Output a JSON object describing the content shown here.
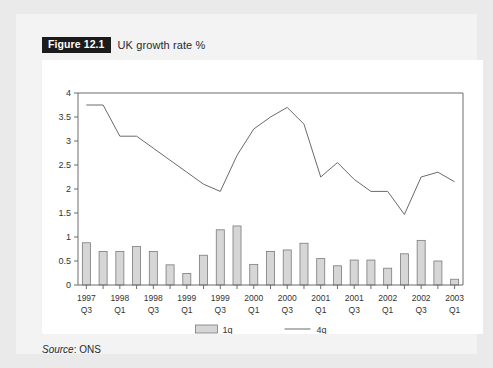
{
  "figure": {
    "badge": "Figure 12.1",
    "title": "UK growth rate %"
  },
  "source": {
    "label": "Source",
    "separator": ":",
    "value": "ONS",
    "full": "Source: ONS"
  },
  "colors": {
    "page_background": "#eaeaea",
    "card_background": "#f3f3f3",
    "plot_background": "#ffffff",
    "badge_background": "#1b1b1b",
    "badge_text": "#ffffff",
    "bar_fill": "#d6d6d6",
    "bar_stroke": "#7a7a7a",
    "line_stroke": "#6a6a6a",
    "axis": "#6d6d6d",
    "text": "#333333"
  },
  "chart_data": {
    "type": "bar",
    "title": "UK growth rate %",
    "xlabel": "",
    "ylabel": "",
    "ylim": [
      0,
      4
    ],
    "yticks": [
      0,
      0.5,
      1,
      1.5,
      2,
      2.5,
      3,
      3.5,
      4
    ],
    "ytick_labels": [
      "0",
      "0.5",
      "1",
      "1.5",
      "2",
      "2.5",
      "3",
      "3.5",
      "4"
    ],
    "grid": false,
    "legend_position": "bottom-center",
    "categories": [
      "1997 Q3",
      "1997 Q4",
      "1998 Q1",
      "1998 Q2",
      "1998 Q3",
      "1998 Q4",
      "1999 Q1",
      "1999 Q2",
      "1999 Q3",
      "1999 Q4",
      "2000 Q1",
      "2000 Q2",
      "2000 Q3",
      "2000 Q4",
      "2001 Q1",
      "2001 Q2",
      "2001 Q3",
      "2001 Q4",
      "2002 Q1",
      "2002 Q2",
      "2002 Q3",
      "2002 Q4",
      "2003 Q1"
    ],
    "xtick_labels": [
      {
        "index": 0,
        "year": "1997",
        "quarter": "Q3"
      },
      {
        "index": 2,
        "year": "1998",
        "quarter": "Q1"
      },
      {
        "index": 4,
        "year": "1998",
        "quarter": "Q3"
      },
      {
        "index": 6,
        "year": "1999",
        "quarter": "Q1"
      },
      {
        "index": 8,
        "year": "1999",
        "quarter": "Q3"
      },
      {
        "index": 10,
        "year": "2000",
        "quarter": "Q1"
      },
      {
        "index": 12,
        "year": "2000",
        "quarter": "Q3"
      },
      {
        "index": 14,
        "year": "2001",
        "quarter": "Q1"
      },
      {
        "index": 16,
        "year": "2001",
        "quarter": "Q3"
      },
      {
        "index": 18,
        "year": "2002",
        "quarter": "Q1"
      },
      {
        "index": 20,
        "year": "2002",
        "quarter": "Q3"
      },
      {
        "index": 22,
        "year": "2003",
        "quarter": "Q1"
      }
    ],
    "series": [
      {
        "name": "1q",
        "type": "bar",
        "values": [
          0.88,
          0.7,
          0.7,
          0.8,
          0.7,
          0.42,
          0.24,
          0.62,
          1.15,
          1.23,
          0.43,
          0.7,
          0.73,
          0.87,
          0.55,
          0.4,
          0.52,
          0.52,
          0.35,
          0.65,
          0.93,
          0.5,
          0.12
        ]
      },
      {
        "name": "4q",
        "type": "line",
        "values": [
          3.75,
          3.75,
          3.1,
          3.1,
          2.85,
          2.6,
          2.35,
          2.1,
          1.95,
          2.7,
          3.25,
          3.5,
          3.7,
          3.35,
          2.25,
          2.55,
          2.2,
          1.95,
          1.95,
          1.47,
          2.25,
          2.35,
          2.15
        ]
      }
    ],
    "legend": [
      {
        "label": "1q",
        "marker": "bar-swatch"
      },
      {
        "label": "4q",
        "marker": "line-swatch"
      }
    ]
  }
}
